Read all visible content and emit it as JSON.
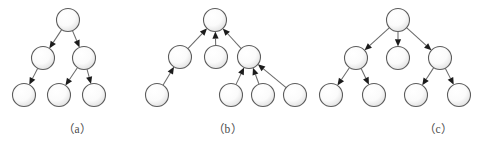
{
  "figure": {
    "width": 490,
    "height": 148,
    "background": "#ffffff",
    "node": {
      "radius": 11.5,
      "fill_light": "#ffffff",
      "fill_shade": "#e4e4e4",
      "stroke": "#5c5c5c"
    },
    "edge": {
      "stroke": "#6b6b6b",
      "arrow_fill": "#1c1c1c"
    },
    "caption_color": "#4a4a4a"
  },
  "panels": [
    {
      "id": "panel-a",
      "caption": "（a）",
      "caption_x": 63,
      "caption_y": 120,
      "direction": "downward",
      "nodes": [
        {
          "id": "a-root",
          "name": "node-a-root",
          "x": 68,
          "y": 20
        },
        {
          "id": "a-l",
          "name": "node-a-left",
          "x": 43,
          "y": 58
        },
        {
          "id": "a-r",
          "name": "node-a-right",
          "x": 84,
          "y": 58
        },
        {
          "id": "a-ll",
          "name": "node-a-leaf-1",
          "x": 24,
          "y": 95
        },
        {
          "id": "a-rl",
          "name": "node-a-leaf-2",
          "x": 59,
          "y": 95
        },
        {
          "id": "a-rr",
          "name": "node-a-leaf-3",
          "x": 94,
          "y": 95
        }
      ],
      "edges": [
        {
          "from": "a-root",
          "to": "a-l"
        },
        {
          "from": "a-root",
          "to": "a-r"
        },
        {
          "from": "a-l",
          "to": "a-ll"
        },
        {
          "from": "a-r",
          "to": "a-rl"
        },
        {
          "from": "a-r",
          "to": "a-rr"
        }
      ]
    },
    {
      "id": "panel-b",
      "caption": "（b）",
      "caption_x": 213,
      "caption_y": 120,
      "direction": "upward",
      "nodes": [
        {
          "id": "b-root",
          "name": "node-b-root",
          "x": 215,
          "y": 20
        },
        {
          "id": "b-m1",
          "name": "node-b-mid-1",
          "x": 180,
          "y": 57
        },
        {
          "id": "b-m2",
          "name": "node-b-mid-2",
          "x": 216,
          "y": 57
        },
        {
          "id": "b-m3",
          "name": "node-b-mid-3",
          "x": 249,
          "y": 57
        },
        {
          "id": "b-l0",
          "name": "node-b-leaf-0",
          "x": 157,
          "y": 95
        },
        {
          "id": "b-l1",
          "name": "node-b-leaf-1",
          "x": 231,
          "y": 95
        },
        {
          "id": "b-l2",
          "name": "node-b-leaf-2",
          "x": 263,
          "y": 95
        },
        {
          "id": "b-l3",
          "name": "node-b-leaf-3",
          "x": 295,
          "y": 95
        }
      ],
      "edges": [
        {
          "from": "b-m1",
          "to": "b-root"
        },
        {
          "from": "b-m2",
          "to": "b-root"
        },
        {
          "from": "b-m3",
          "to": "b-root"
        },
        {
          "from": "b-l0",
          "to": "b-m1"
        },
        {
          "from": "b-l1",
          "to": "b-m3"
        },
        {
          "from": "b-l2",
          "to": "b-m3"
        },
        {
          "from": "b-l3",
          "to": "b-m3"
        }
      ]
    },
    {
      "id": "panel-c",
      "caption": "（c）",
      "caption_x": 424,
      "caption_y": 120,
      "direction": "downward",
      "nodes": [
        {
          "id": "c-root",
          "name": "node-c-root",
          "x": 398,
          "y": 20
        },
        {
          "id": "c-m1",
          "name": "node-c-mid-1",
          "x": 356,
          "y": 58
        },
        {
          "id": "c-m2",
          "name": "node-c-mid-2",
          "x": 398,
          "y": 58
        },
        {
          "id": "c-m3",
          "name": "node-c-mid-3",
          "x": 440,
          "y": 58
        },
        {
          "id": "c-l1",
          "name": "node-c-leaf-1",
          "x": 331,
          "y": 95
        },
        {
          "id": "c-l2",
          "name": "node-c-leaf-2",
          "x": 374,
          "y": 95
        },
        {
          "id": "c-l3",
          "name": "node-c-leaf-3",
          "x": 416,
          "y": 95
        },
        {
          "id": "c-l4",
          "name": "node-c-leaf-4",
          "x": 459,
          "y": 95
        }
      ],
      "edges": [
        {
          "from": "c-root",
          "to": "c-m1"
        },
        {
          "from": "c-root",
          "to": "c-m2"
        },
        {
          "from": "c-root",
          "to": "c-m3"
        },
        {
          "from": "c-m1",
          "to": "c-l1"
        },
        {
          "from": "c-m1",
          "to": "c-l2"
        },
        {
          "from": "c-m3",
          "to": "c-l3"
        },
        {
          "from": "c-m3",
          "to": "c-l4"
        }
      ]
    }
  ]
}
